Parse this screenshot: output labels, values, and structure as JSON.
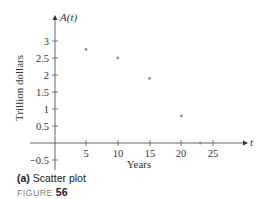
{
  "chart_data": {
    "type": "scatter",
    "title": "",
    "xlabel": "Years",
    "ylabel": "Trillion dollars",
    "x_var": "t",
    "y_var": "A(t)",
    "x_ticks": [
      5,
      10,
      15,
      20,
      25
    ],
    "y_ticks": [
      -0.5,
      0.5,
      1,
      1.5,
      2,
      2.5,
      3
    ],
    "xlim": [
      0,
      28
    ],
    "ylim": [
      -0.6,
      3.6
    ],
    "grid": false,
    "legend": null,
    "series": [
      {
        "name": "A(t)",
        "points": [
          {
            "x": 5,
            "y": 2.75
          },
          {
            "x": 10,
            "y": 2.5
          },
          {
            "x": 15,
            "y": 1.9
          },
          {
            "x": 20,
            "y": 0.8
          },
          {
            "x": 23,
            "y": 0
          }
        ]
      }
    ],
    "colors": {
      "axis": "#555555",
      "point": "#8c8c8c",
      "text": "#333333"
    }
  },
  "caption": {
    "label": "(a)",
    "text": "Scatter plot"
  },
  "figure": {
    "label": "FIGURE",
    "number": "56"
  },
  "labels": {
    "y_axis_var": "A(t)",
    "x_axis_var": "t",
    "y_axis_title": "Trillion dollars",
    "x_axis_title": "Years",
    "xt0": "5",
    "xt1": "10",
    "xt2": "15",
    "xt3": "20",
    "xt4": "25",
    "yt_m05": "−0.5",
    "yt05": "0.5",
    "yt1": "1",
    "yt15": "1.5",
    "yt2": "2",
    "yt25": "2.5",
    "yt3": "3"
  }
}
